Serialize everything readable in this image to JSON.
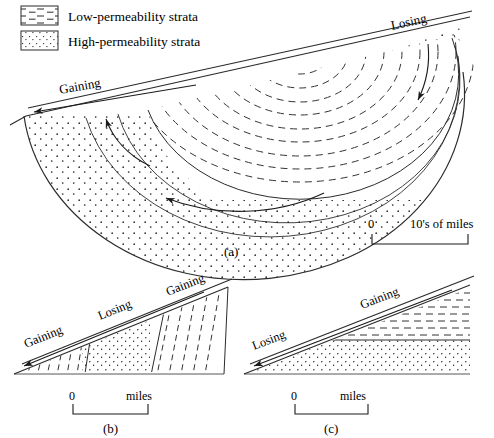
{
  "legend": {
    "items": [
      {
        "key": "low-permeability",
        "label": "Low-permeability strata",
        "pattern": "horizontal-dashes"
      },
      {
        "key": "high-permeability",
        "label": "High-permeability strata",
        "pattern": "stipple-dots"
      }
    ]
  },
  "panels": [
    {
      "id": "a",
      "caption": "(a)",
      "labels": [
        {
          "name": "gaining-left",
          "text": "Gaining"
        },
        {
          "name": "losing-right",
          "text": "Losing"
        }
      ],
      "scale": {
        "zero": "0",
        "unit": "10's of miles"
      },
      "arrows": [
        {
          "name": "surface-discharge-arrow",
          "direction": "left"
        },
        {
          "name": "shallow-flow-arrow",
          "direction": "up-left"
        },
        {
          "name": "deep-flow-arrow",
          "direction": "left"
        },
        {
          "name": "recharge-arrow",
          "direction": "down"
        }
      ]
    },
    {
      "id": "b",
      "caption": "(b)",
      "labels": [
        {
          "name": "gaining-left",
          "text": "Gaining"
        },
        {
          "name": "losing-middle",
          "text": "Losing"
        },
        {
          "name": "gaining-right",
          "text": "Gaining"
        }
      ],
      "scale": {
        "zero": "0",
        "unit": "miles"
      },
      "arrows": [
        {
          "name": "surface-discharge-arrow",
          "direction": "left"
        }
      ]
    },
    {
      "id": "c",
      "caption": "(c)",
      "labels": [
        {
          "name": "losing-left",
          "text": "Losing"
        },
        {
          "name": "gaining-right",
          "text": "Gaining"
        }
      ],
      "scale": {
        "zero": "0",
        "unit": "miles"
      },
      "arrows": [
        {
          "name": "surface-discharge-arrow",
          "direction": "left"
        }
      ]
    }
  ],
  "colors": {
    "ink": "#1a1a1a",
    "line": "#2b2b2b",
    "dash": "#333333",
    "background": "#ffffff"
  }
}
